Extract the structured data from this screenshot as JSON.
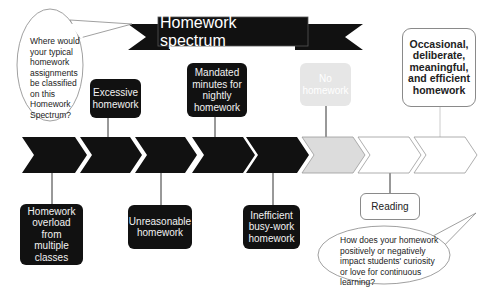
{
  "title": "Homework spectrum",
  "colors": {
    "dark": "#111111",
    "faded": "#e6e6e6",
    "outline": "#8a8a8a",
    "background": "#ffffff"
  },
  "spectrum": {
    "chevron_count": 8,
    "chevrons": [
      {
        "index": 1,
        "fill": "#111111"
      },
      {
        "index": 2,
        "fill": "#111111"
      },
      {
        "index": 3,
        "fill": "#111111"
      },
      {
        "index": 4,
        "fill": "#111111"
      },
      {
        "index": 5,
        "fill": "#111111"
      },
      {
        "index": 6,
        "fill": "#dddddd"
      },
      {
        "index": 7,
        "fill": "#ffffff"
      },
      {
        "index": 8,
        "fill": "#ffffff"
      }
    ]
  },
  "top_labels": [
    {
      "text": "Excessive homework",
      "style": "dark"
    },
    {
      "text": "Mandated minutes for nightly homework",
      "style": "dark"
    },
    {
      "text": "No homework",
      "style": "faded"
    },
    {
      "text": "Occasional, deliberate, meaningful, and efficient homework",
      "style": "outline-bold"
    }
  ],
  "bottom_labels": [
    {
      "text": "Homework overload from multiple classes",
      "style": "dark"
    },
    {
      "text": "Unreasonable homework",
      "style": "dark"
    },
    {
      "text": "Inefficient busy-work homework",
      "style": "dark"
    },
    {
      "text": "Reading",
      "style": "outline"
    }
  ],
  "callouts": {
    "left": "Where would your typical homework assignments be classified on this Homework Spectrum?",
    "bottom_right": "How does your homework positively or negatively impact students' curiosity or love for continuous learning?"
  }
}
